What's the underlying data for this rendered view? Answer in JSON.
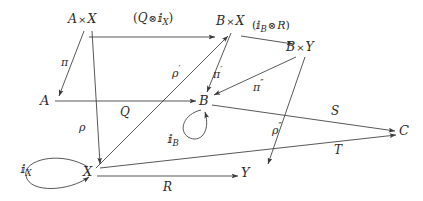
{
  "diagram": {
    "kind": "commutative-diagram",
    "background_color": "#ffffff",
    "stroke_color": "#3a3a3a",
    "text_color": "#2b2b2b",
    "objects": [
      {
        "id": "AxX",
        "label": "A×X",
        "x": 86,
        "y": 20
      },
      {
        "id": "BxX",
        "label": "B×X",
        "x": 234,
        "y": 22
      },
      {
        "id": "BxY",
        "label": "B×Y",
        "x": 303,
        "y": 48
      },
      {
        "id": "A",
        "label": "A",
        "x": 46,
        "y": 100
      },
      {
        "id": "B",
        "label": "B",
        "x": 203,
        "y": 100
      },
      {
        "id": "C",
        "label": "C",
        "x": 404,
        "y": 130
      },
      {
        "id": "X",
        "label": "X",
        "x": 88,
        "y": 171
      },
      {
        "id": "Y",
        "label": "Y",
        "x": 246,
        "y": 172
      }
    ],
    "morphisms": [
      {
        "id": "m1",
        "label": "(Q ⊗ 𝕀X)",
        "label_text": "(Q ⊗ ⅈ_X)",
        "from": "AxX",
        "to": "BxX"
      },
      {
        "id": "m2",
        "label": "(𝕀B ⊗ R)",
        "label_text": "(ⅈ_B ⊗ R)",
        "from": "BxX",
        "to": "BxY"
      },
      {
        "id": "m3",
        "label": "π",
        "from": "AxX",
        "to": "A"
      },
      {
        "id": "m4",
        "label": "ρ",
        "from": "AxX",
        "to": "X"
      },
      {
        "id": "m5",
        "label": "ρ′",
        "from": "X",
        "to": "BxX"
      },
      {
        "id": "m6",
        "label": "π′",
        "from": "BxX",
        "to": "B"
      },
      {
        "id": "m7",
        "label": "π″",
        "from": "BxY",
        "to": "B"
      },
      {
        "id": "m8",
        "label": "ρ″",
        "from": "BxY",
        "to": "Y"
      },
      {
        "id": "m9",
        "label": "Q",
        "from": "A",
        "to": "B"
      },
      {
        "id": "m10",
        "label": "R",
        "from": "X",
        "to": "Y"
      },
      {
        "id": "m11",
        "label": "S",
        "from": "B",
        "to": "C"
      },
      {
        "id": "m12",
        "label": "T",
        "from": "X",
        "to": "C"
      },
      {
        "id": "m13",
        "label": "𝕀X",
        "label_text": "ⅈ_X",
        "from": "X",
        "to": "X",
        "type": "loop"
      },
      {
        "id": "m14",
        "label": "𝕀B",
        "label_text": "ⅈ_B",
        "from": "B",
        "to": "B",
        "type": "loop"
      }
    ],
    "labels": {
      "AxX": {
        "base": "A",
        "times": "×",
        "second": "X"
      },
      "BxX": {
        "base": "B",
        "times": "×",
        "second": "X"
      },
      "BxY": {
        "base": "B",
        "times": "×",
        "second": "Y"
      },
      "A": "A",
      "B": "B",
      "C": "C",
      "X": "X",
      "Y": "Y",
      "Q": "Q",
      "R": "R",
      "S": "S",
      "T": "T",
      "pi": "π",
      "pi_prime": "π",
      "pi_dprime": "π",
      "rho": "ρ",
      "rho_prime": "ρ",
      "rho_dprime": "ρ",
      "id_blackboard": "ⅈ",
      "tensor": "⊗",
      "sub_X": "X",
      "sub_B": "B",
      "paren_open": "(",
      "paren_close": ")",
      "prime": "′",
      "double_prime": "″"
    }
  }
}
